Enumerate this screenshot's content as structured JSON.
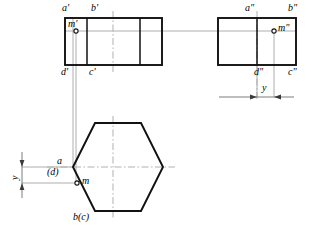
{
  "drawing": {
    "title": "Orthographic projection of a hexagonal prism with point M",
    "type": "descriptive-geometry-projection",
    "canvas": {
      "width": 311,
      "height": 232
    },
    "colors": {
      "outline": "#1a1a1a",
      "thin_line": "#555555",
      "center_line": "#9a9a9a",
      "projection_line": "#8c8c8c",
      "background": "#ffffff"
    },
    "views": {
      "front": {
        "name": "front-view",
        "rect": {
          "x": 65,
          "y": 18,
          "width": 97,
          "height": 47
        },
        "internal_vertical_lines_x": [
          87,
          140
        ],
        "corner_labels": {
          "top_left": "a'",
          "top_inner": "b'",
          "bottom_left": "d'",
          "bottom_inner": "c'"
        },
        "point": {
          "label": "m'",
          "x": 76,
          "y": 31
        }
      },
      "side": {
        "name": "side-view",
        "rect": {
          "x": 218,
          "y": 18,
          "width": 78,
          "height": 47
        },
        "internal_vertical_lines_x": [
          257
        ],
        "corner_labels": {
          "top_inner": "a\"",
          "top_right": "b\"",
          "bottom_inner": "d\"",
          "bottom_right": "c\""
        },
        "point": {
          "label": "m\"",
          "x": 274,
          "y": 31
        }
      },
      "top": {
        "name": "top-view",
        "hexagon": {
          "left_vertex_x": 73,
          "right_vertex_x": 163,
          "center_y": 167,
          "top_y": 123,
          "bottom_y": 211,
          "flat_left_x": 95,
          "flat_right_x": 141
        },
        "corner_labels": {
          "left_upper": "a",
          "left_hidden": "(d)",
          "bottom": "b(c)"
        },
        "point": {
          "label": "m",
          "x": 77,
          "y": 183
        }
      }
    },
    "dimensions": [
      {
        "name": "y-dimension-side-view",
        "label": "y",
        "x": 248,
        "y": 90,
        "from_x": 220,
        "to_x": 276
      },
      {
        "name": "y-dimension-top-view",
        "label": "y",
        "x": 12,
        "y": 175,
        "from_y": 167,
        "to_y": 183
      }
    ],
    "labels": [
      {
        "id": "a-prime",
        "text": "a'",
        "x": 63,
        "y": 4
      },
      {
        "id": "b-prime",
        "text": "b'",
        "x": 92,
        "y": 4
      },
      {
        "id": "m-prime",
        "text": "m'",
        "x": 70,
        "y": 21
      },
      {
        "id": "d-prime",
        "text": "d'",
        "x": 62,
        "y": 68
      },
      {
        "id": "c-prime",
        "text": "c'",
        "x": 90,
        "y": 68
      },
      {
        "id": "a-double-prime",
        "text": "a\"",
        "x": 246,
        "y": 4
      },
      {
        "id": "b-double-prime",
        "text": "b\"",
        "x": 290,
        "y": 4
      },
      {
        "id": "m-double-prime",
        "text": "m\"",
        "x": 279,
        "y": 26
      },
      {
        "id": "d-double-prime",
        "text": "d\"",
        "x": 256,
        "y": 68
      },
      {
        "id": "c-double-prime",
        "text": "c\"",
        "x": 290,
        "y": 68
      },
      {
        "id": "y-side",
        "text": "y",
        "x": 252,
        "y": 84
      },
      {
        "id": "a-top",
        "text": "a",
        "x": 57,
        "y": 157
      },
      {
        "id": "d-top",
        "text": "(d)",
        "x": 50,
        "y": 169
      },
      {
        "id": "m-top",
        "text": "m",
        "x": 83,
        "y": 178
      },
      {
        "id": "bc-top",
        "text": "b(c)",
        "x": 75,
        "y": 214
      },
      {
        "id": "y-top",
        "text": "y",
        "x": 12,
        "y": 180
      }
    ]
  }
}
